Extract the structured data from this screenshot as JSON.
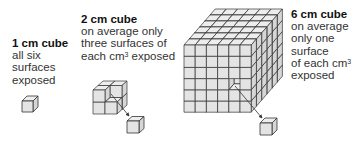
{
  "figure": {
    "panels": [
      {
        "id": "cube-1cm",
        "title": "1 cm cube",
        "lines": [
          "all six",
          "surfaces",
          "exposed"
        ]
      },
      {
        "id": "cube-2cm",
        "title": "2 cm cube",
        "lines": [
          "on average only",
          "three surfaces of"
        ],
        "last_line_prefix": "each cm",
        "superscript": "3",
        "last_line_suffix": " exposed"
      },
      {
        "id": "cube-6cm",
        "title": "6 cm cube",
        "lines": [
          "on average",
          "only one",
          "surface"
        ],
        "last_line_prefix": "of each cm",
        "superscript": "3",
        "last_line_suffix": "",
        "final_line": "exposed"
      }
    ],
    "colors": {
      "face_front": "#e4e4e4",
      "face_top": "#ededed",
      "face_side": "#d6d6d6",
      "edge": "#333333",
      "background": "#ffffff"
    }
  }
}
